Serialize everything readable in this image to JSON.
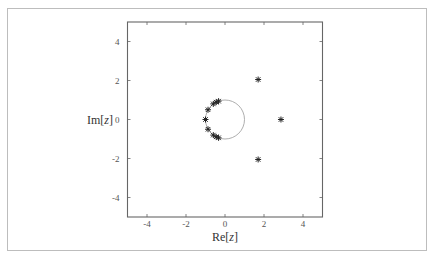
{
  "chart_data": {
    "type": "scatter",
    "title": "",
    "xlabel": "Re[z]",
    "ylabel": "Im[z]",
    "xlabel_parts": {
      "prefix": "Re[",
      "var": "z",
      "suffix": "]"
    },
    "ylabel_parts": {
      "prefix": "Im[",
      "var": "z",
      "suffix": "]"
    },
    "xlim": [
      -5,
      5
    ],
    "ylim": [
      -5,
      5
    ],
    "xticks": [
      -4,
      -2,
      0,
      2,
      4
    ],
    "yticks": [
      -4,
      -2,
      0,
      2,
      4
    ],
    "grid": false,
    "marker": "asterisk",
    "annotations": [
      "unit circle centered at origin, radius 1"
    ],
    "unit_circle": {
      "cx": 0,
      "cy": 0,
      "r": 1
    },
    "series": [
      {
        "name": "roots",
        "points": [
          {
            "x": -1.0,
            "y": 0.0
          },
          {
            "x": -0.87,
            "y": 0.5
          },
          {
            "x": -0.87,
            "y": -0.5
          },
          {
            "x": -0.6,
            "y": 0.8
          },
          {
            "x": -0.6,
            "y": -0.8
          },
          {
            "x": -0.45,
            "y": 0.89
          },
          {
            "x": -0.45,
            "y": -0.89
          },
          {
            "x": -0.33,
            "y": 0.94
          },
          {
            "x": -0.33,
            "y": -0.94
          },
          {
            "x": 1.7,
            "y": 2.05
          },
          {
            "x": 1.7,
            "y": -2.05
          },
          {
            "x": 2.87,
            "y": 0.0
          }
        ]
      }
    ]
  },
  "colors": {
    "frame": "#bdbdbd",
    "axes": "#666666",
    "circle": "#999999",
    "marker": "#222222"
  }
}
